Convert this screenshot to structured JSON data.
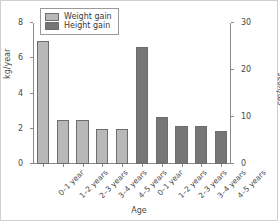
{
  "chart_data": {
    "type": "bar",
    "title": "",
    "xlabel": "Age",
    "ylabel": "kg/year",
    "ylabel_right": "cm/year",
    "categories": [
      "0–1 year",
      "1–2 years",
      "2–3 years",
      "3–4 years",
      "4–5 years"
    ],
    "series": [
      {
        "name": "Weight gain",
        "unit": "kg/year",
        "axis": "left",
        "color": "#b8b8b8",
        "values": [
          7.0,
          2.5,
          2.5,
          2.0,
          2.0
        ]
      },
      {
        "name": "Height gain",
        "unit": "cm/year",
        "axis": "right",
        "color": "#767676",
        "values": [
          25.0,
          10.0,
          8.0,
          8.0,
          7.0
        ]
      }
    ],
    "ylim": [
      0,
      8
    ],
    "ylim_right": [
      0,
      30
    ],
    "yticks": [
      0,
      2,
      4,
      6,
      8
    ],
    "yticks_right": [
      0,
      10,
      20,
      30
    ],
    "grid": false,
    "legend_position": "top-left"
  },
  "legend": {
    "items": [
      {
        "label": "Weight gain",
        "color": "#b8b8b8"
      },
      {
        "label": "Height gain",
        "color": "#767676"
      }
    ]
  }
}
